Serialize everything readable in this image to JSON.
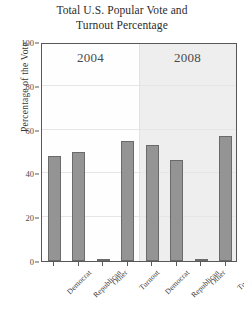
{
  "chart_data": {
    "type": "bar",
    "title": "Total U.S. Popular Vote and Turnout Percentage",
    "title_lines": [
      "Total U.S. Popular Vote and",
      "Turnout Percentage"
    ],
    "xlabel": "",
    "ylabel": "Percentage of the Vote",
    "ylim": [
      0,
      100
    ],
    "yticks": [
      0,
      20,
      40,
      60,
      80,
      100
    ],
    "ytick_labels": [
      "0",
      "20",
      "40",
      "60",
      "80",
      "100"
    ],
    "grid": true,
    "legend": "none",
    "panels": [
      {
        "label": "2004",
        "categories": [
          "Democrat",
          "Republican",
          "Other",
          "Turnout"
        ],
        "values": [
          48,
          50,
          1,
          55
        ]
      },
      {
        "label": "2008",
        "categories": [
          "Democrat",
          "Republican",
          "Other",
          "Turnout"
        ],
        "values": [
          53,
          46,
          1,
          57
        ]
      }
    ],
    "colors": {
      "bar_fill": "#949494",
      "bar_edge": "#6a6a6a",
      "panel_2004_bg": "#fefefe",
      "panel_2008_bg": "#eeeeee",
      "grid": "#e6e6e6",
      "frame": "#585858",
      "text": "#3a3a3a"
    }
  }
}
